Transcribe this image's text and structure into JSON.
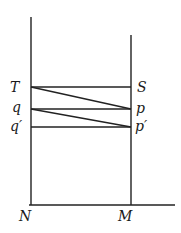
{
  "diagram": {
    "labels": {
      "T": "T",
      "S": "S",
      "q": "q",
      "p": "p",
      "q_prime": "q′",
      "p_prime": "p′",
      "N": "N",
      "M": "M"
    },
    "lines": [
      {
        "name": "left-vertical-N",
        "from": [
          31,
          17
        ],
        "to": [
          31,
          205
        ]
      },
      {
        "name": "right-vertical-M",
        "from": [
          131,
          35
        ],
        "to": [
          131,
          205
        ]
      },
      {
        "name": "base-line",
        "from": [
          29,
          205
        ],
        "to": [
          175,
          205
        ]
      },
      {
        "name": "T-S",
        "from": [
          31,
          87
        ],
        "to": [
          131,
          87
        ]
      },
      {
        "name": "q-p",
        "from": [
          31,
          109
        ],
        "to": [
          131,
          109
        ]
      },
      {
        "name": "q'-p'",
        "from": [
          31,
          127
        ],
        "to": [
          131,
          127
        ]
      },
      {
        "name": "T-p",
        "from": [
          31,
          87
        ],
        "to": [
          131,
          109
        ]
      },
      {
        "name": "q-p'",
        "from": [
          31,
          109
        ],
        "to": [
          131,
          127
        ]
      }
    ]
  }
}
